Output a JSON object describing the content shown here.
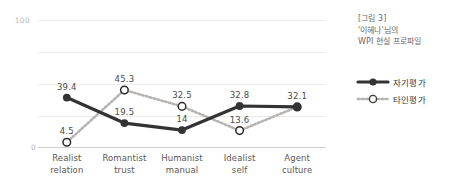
{
  "chart_data": {
    "type": "line",
    "title": "",
    "categories": [
      "Realist relation",
      "Romantist trust",
      "Humanist manual",
      "Idealist self",
      "Agent culture"
    ],
    "category_lines": [
      [
        "Realist",
        "relation"
      ],
      [
        "Romantist",
        "trust"
      ],
      [
        "Humanist",
        "manual"
      ],
      [
        "Idealist",
        "self"
      ],
      [
        "Agent",
        "culture"
      ]
    ],
    "series": [
      {
        "name": "자기평가",
        "values": [
          39.4,
          19.5,
          14,
          32.8,
          32.1
        ],
        "labels": [
          "39.4",
          "19.5",
          "14",
          "32.8",
          "32.1"
        ],
        "style": "solid",
        "marker": "filled-circle",
        "color": "#333333"
      },
      {
        "name": "타인평가",
        "values": [
          4.5,
          45.3,
          32.5,
          13.6,
          32.1
        ],
        "labels": [
          "4.5",
          "45.3",
          "32.5",
          "13.6",
          ""
        ],
        "style": "dotted",
        "marker": "hollow-circle",
        "color": "#b5b2b0"
      }
    ],
    "xlabel": "",
    "ylabel": "",
    "ylim": [
      0,
      100
    ],
    "ytick_labels": [
      "100",
      "0"
    ],
    "gridlines": [
      100,
      75,
      50,
      25
    ],
    "grid": true,
    "legend_position": "right"
  },
  "caption": {
    "line1": "[그림 3]",
    "line2": "'이혜나'님의",
    "line3": "WPI 현실 프로파일"
  },
  "legend": {
    "items": [
      {
        "label": "자기평가"
      },
      {
        "label": "타인평가"
      }
    ]
  },
  "colors": {
    "self_line": "#333333",
    "other_line": "#b5b2b0",
    "grid": "#eceaea",
    "axis": "#cfcdcd",
    "tick_text": "#b9b6b4",
    "label_text": "#4c4a49",
    "category_text": "#5a5754",
    "caption_text": "#6d6a68"
  }
}
